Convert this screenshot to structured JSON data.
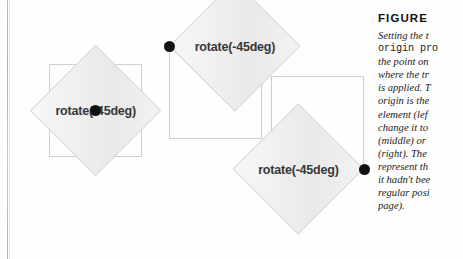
{
  "page": {
    "background_color": "#ffffff",
    "gutter_line_color": "#7a7a7a"
  },
  "figure": {
    "heading": "FIGURE",
    "caption_lines": [
      "Setting the t",
      "origin pro",
      "the point on",
      "where the tr",
      "is applied. T",
      "origin is the",
      "element (lef",
      "change it to",
      "(middle) or ",
      "(right). The ",
      "represent th",
      "it hadn't bee",
      "regular posi",
      "page)."
    ],
    "caption_note": "Caption text is clipped by the right edge of the screenshot."
  },
  "diagrams": [
    {
      "id": "left",
      "label": "rotate(-45deg)",
      "origin_position": "center",
      "origin_dot_color": "#111111",
      "square_fill": "#eeeeee",
      "square_border": "#d5d5d5",
      "ghost_border": "#cfcfcf",
      "rotation": "-45deg"
    },
    {
      "id": "middle",
      "label": "rotate(-45deg)",
      "origin_position": "top-left",
      "origin_dot_color": "#111111",
      "square_fill": "#eeeeee",
      "square_border": "#d5d5d5",
      "ghost_border": "#cfcfcf",
      "rotation": "-45deg"
    },
    {
      "id": "right",
      "label": "rotate(-45deg)",
      "origin_position": "bottom-right",
      "origin_dot_color": "#111111",
      "square_fill": "#eeeeee",
      "square_border": "#d5d5d5",
      "ghost_border": "#cfcfcf",
      "rotation": "-45deg"
    }
  ]
}
